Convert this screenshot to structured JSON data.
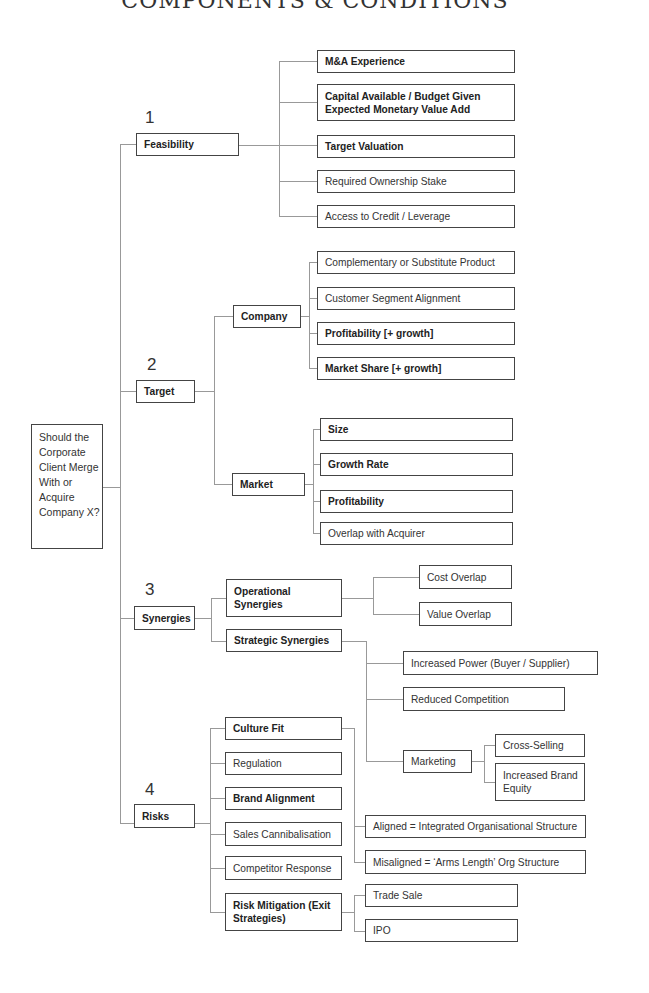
{
  "title": "COMPONENTS & CONDITIONS",
  "root": {
    "label": "Should the Corporate Client Merge With or Acquire Company X?"
  },
  "branches": [
    {
      "number": "1",
      "label": "Feasibility",
      "children": [
        {
          "label": "M&A Experience",
          "bold": true
        },
        {
          "label": "Capital Available / Budget Given Expected Monetary Value Add",
          "bold": true
        },
        {
          "label": "Target Valuation",
          "bold": true
        },
        {
          "label": "Required Ownership Stake",
          "bold": false
        },
        {
          "label": "Access to Credit / Leverage",
          "bold": false
        }
      ]
    },
    {
      "number": "2",
      "label": "Target",
      "children": [
        {
          "label": "Company",
          "children": [
            {
              "label": "Complementary or Substitute Product",
              "bold": false
            },
            {
              "label": "Customer Segment Alignment",
              "bold": false
            },
            {
              "label": "Profitability [+ growth]",
              "bold": true
            },
            {
              "label": "Market Share [+ growth]",
              "bold": true
            }
          ]
        },
        {
          "label": "Market",
          "children": [
            {
              "label": "Size",
              "bold": true
            },
            {
              "label": "Growth Rate",
              "bold": true
            },
            {
              "label": "Profitability",
              "bold": true
            },
            {
              "label": "Overlap with Acquirer",
              "bold": false
            }
          ]
        }
      ]
    },
    {
      "number": "3",
      "label": "Synergies",
      "children": [
        {
          "label": "Operational Synergies",
          "children": [
            {
              "label": "Cost Overlap"
            },
            {
              "label": "Value Overlap"
            }
          ]
        },
        {
          "label": "Strategic Synergies",
          "children": [
            {
              "label": "Increased Power (Buyer / Supplier)"
            },
            {
              "label": "Reduced Competition"
            },
            {
              "label": "Marketing",
              "children": [
                {
                  "label": "Cross-Selling"
                },
                {
                  "label": "Increased Brand Equity"
                }
              ]
            }
          ]
        }
      ]
    },
    {
      "number": "4",
      "label": "Risks",
      "children": [
        {
          "label": "Culture Fit",
          "bold": true,
          "children": [
            {
              "label": "Aligned = Integrated Organisational Structure"
            },
            {
              "label": "Misaligned = ‘Arms Length’ Org Structure"
            }
          ]
        },
        {
          "label": "Regulation",
          "bold": false
        },
        {
          "label": "Brand Alignment",
          "bold": true
        },
        {
          "label": "Sales Cannibalisation",
          "bold": false
        },
        {
          "label": "Competitor Response",
          "bold": false
        },
        {
          "label": "Risk Mitigation (Exit Strategies)",
          "bold": true,
          "children": [
            {
              "label": "Trade Sale"
            },
            {
              "label": "IPO"
            }
          ]
        }
      ]
    }
  ]
}
